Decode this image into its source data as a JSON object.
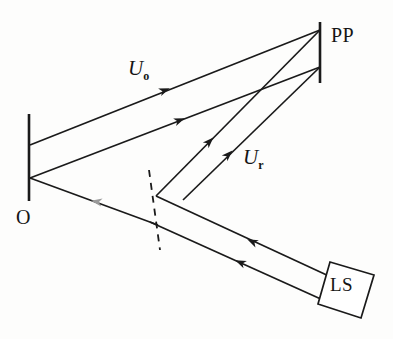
{
  "figure": {
    "type": "optical-diagram",
    "background_color": "#fdfdfc",
    "ink_color": "#1a1a1a",
    "faint_ink_color": "#8e8e8e"
  },
  "labels": {
    "photographic_plate": "PP",
    "object": "O",
    "light_source": "LS",
    "object_wave": "U",
    "object_wave_sub": "o",
    "reference_wave": "U",
    "reference_wave_sub": "r"
  },
  "components": [
    {
      "name": "photographic-plate",
      "label": "PP",
      "shape": "vertical-line",
      "x": 320,
      "y1": 22,
      "y2": 83,
      "stroke_width": 2.6
    },
    {
      "name": "object",
      "label": "O",
      "shape": "vertical-line",
      "x": 29,
      "y1": 114,
      "y2": 201,
      "stroke_width": 2.6
    },
    {
      "name": "light-source",
      "label": "LS",
      "shape": "tilted-square",
      "corners": [
        [
          330,
          262
        ],
        [
          374,
          275
        ],
        [
          361,
          318
        ],
        [
          318,
          304
        ]
      ],
      "stroke_width": 1.7
    },
    {
      "name": "beam-splitter",
      "label": "",
      "shape": "dashed-line",
      "x1": 149,
      "y1": 170,
      "x2": 160,
      "y2": 250,
      "dash": "7 6",
      "stroke_width": 1.8
    }
  ],
  "rays": [
    {
      "name": "object-wave-upper",
      "from": "object-top",
      "to": "plate-top",
      "points": [
        [
          30,
          145
        ],
        [
          320,
          30
        ]
      ],
      "arrow_at": [
        168,
        89
      ],
      "arrow_angle_deg": -21.6,
      "wave": "U_o"
    },
    {
      "name": "object-wave-lower",
      "from": "object-bottom",
      "to": "plate-lower",
      "points": [
        [
          30,
          178
        ],
        [
          320,
          67
        ]
      ],
      "arrow_at": [
        183,
        119
      ],
      "arrow_angle_deg": -21.0,
      "wave": "U_o"
    },
    {
      "name": "reference-wave-inner",
      "from": "beam-splitter-upper",
      "to": "plate-top",
      "points": [
        [
          156,
          196
        ],
        [
          320,
          30
        ]
      ],
      "arrow_at": [
        212,
        139
      ],
      "arrow_angle_deg": -45.3,
      "wave": "U_r"
    },
    {
      "name": "reference-wave-outer",
      "from": "beam-splitter-lower",
      "to": "plate-lower",
      "points": [
        [
          183,
          200
        ],
        [
          320,
          67
        ]
      ],
      "arrow_at": [
        231,
        152
      ],
      "arrow_angle_deg": -44.2,
      "wave": "U_r"
    },
    {
      "name": "source-beam-upper",
      "from": "light-source",
      "to": "beam-splitter-upper",
      "points": [
        [
          330,
          277
        ],
        [
          156,
          196
        ]
      ],
      "arrow_at": [
        249,
        240
      ],
      "arrow_angle_deg": 205.0
    },
    {
      "name": "source-beam-lower",
      "from": "light-source",
      "to": "beam-splitter-lower",
      "points": [
        [
          322,
          300
        ],
        [
          113,
          205
        ]
      ],
      "arrow_at": [
        237,
        261
      ],
      "arrow_angle_deg": 204.5
    },
    {
      "name": "illumination-to-object",
      "from": "beam-splitter",
      "to": "object",
      "points": [
        [
          160,
          215
        ],
        [
          62,
          198
        ]
      ],
      "arrow_at": [
        92,
        200
      ],
      "arrow_angle_deg": 190.0,
      "faint": true
    }
  ],
  "annotations": {
    "arrow_size": 9,
    "label_count": 5
  }
}
